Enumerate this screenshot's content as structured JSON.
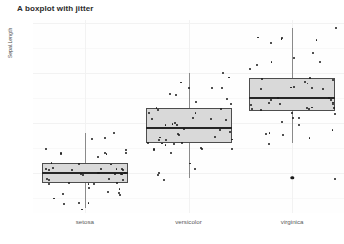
{
  "chart_data": {
    "type": "box",
    "title": "A boxplot with jitter",
    "xlabel": "",
    "ylabel": "Sepal.Length",
    "categories": [
      "setosa",
      "versicolor",
      "virginica"
    ],
    "ylim": [
      4.2,
      8.05
    ],
    "yticks": [
      5,
      6,
      7,
      8
    ],
    "ytick_labels": [
      "5",
      "6",
      "7",
      "8"
    ],
    "grid": true,
    "legend": "none",
    "boxes": [
      {
        "category": "setosa",
        "min": 4.3,
        "q1": 4.8,
        "median": 5.0,
        "q3": 5.2,
        "max": 5.8,
        "outliers": [],
        "points": [
          5.1,
          4.9,
          4.7,
          4.6,
          5.0,
          5.4,
          4.6,
          5.0,
          4.4,
          4.9,
          5.4,
          4.8,
          4.8,
          4.3,
          5.8,
          5.7,
          5.4,
          5.1,
          5.7,
          5.1,
          5.4,
          5.1,
          4.6,
          5.1,
          4.8,
          5.0,
          5.0,
          5.2,
          5.2,
          4.7,
          4.8,
          5.4,
          5.2,
          5.5,
          4.9,
          5.0,
          5.5,
          4.9,
          4.4,
          5.1,
          5.0,
          4.5,
          4.4,
          5.0,
          5.1,
          4.8,
          5.1,
          4.6,
          5.3,
          5.0
        ]
      },
      {
        "category": "versicolor",
        "min": 4.9,
        "q1": 5.6,
        "median": 5.9,
        "q3": 6.3,
        "max": 7.0,
        "outliers": [],
        "points": [
          7.0,
          6.4,
          6.9,
          5.5,
          6.5,
          5.7,
          6.3,
          4.9,
          6.6,
          5.2,
          5.0,
          5.9,
          6.0,
          6.1,
          5.6,
          6.7,
          5.6,
          5.8,
          6.2,
          5.6,
          5.9,
          6.1,
          6.3,
          6.1,
          6.4,
          6.6,
          6.8,
          6.7,
          6.0,
          5.7,
          5.5,
          5.5,
          5.8,
          6.0,
          5.4,
          6.0,
          6.7,
          6.3,
          5.6,
          5.5,
          5.5,
          6.1,
          5.8,
          5.0,
          5.6,
          5.7,
          5.7,
          6.2,
          5.1,
          5.7
        ]
      },
      {
        "category": "virginica",
        "min": 5.6,
        "q1": 6.225,
        "median": 6.5,
        "q3": 6.9,
        "max": 7.9,
        "outliers": [
          4.9
        ],
        "points": [
          6.3,
          5.8,
          7.1,
          6.3,
          6.5,
          7.6,
          4.9,
          7.3,
          6.7,
          7.2,
          6.5,
          6.4,
          6.8,
          5.7,
          5.8,
          6.4,
          6.5,
          7.7,
          7.7,
          6.0,
          6.9,
          5.6,
          7.7,
          6.3,
          6.7,
          7.2,
          6.2,
          6.1,
          6.4,
          7.2,
          7.4,
          7.9,
          6.4,
          6.3,
          6.1,
          7.7,
          6.3,
          6.4,
          6.0,
          6.9,
          6.7,
          6.9,
          5.8,
          6.8,
          6.7,
          6.7,
          6.3,
          6.5,
          6.2,
          5.9
        ]
      }
    ]
  },
  "colors": {
    "box_fill": "#d9d9d9",
    "box_border": "#4d4d4d",
    "median": "#262626",
    "point": "#1a1a1a",
    "whisker": "#8a8a8a",
    "panel_bg": "#fefefe",
    "grid": "#f2f2f2",
    "title": "#2b2b2b"
  }
}
